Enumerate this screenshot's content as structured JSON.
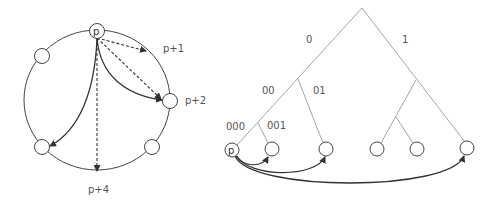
{
  "ring_diagram": {
    "node_label_p": "p",
    "labels": {
      "p_plus_1": "p+1",
      "p_plus_2": "p+2",
      "p_plus_4": "p+4"
    }
  },
  "tree_diagram": {
    "node_label_p": "p",
    "edge_labels": {
      "root_left": "0",
      "root_right": "1",
      "left_left": "00",
      "left_right": "01",
      "leaf_000": "000",
      "leaf_001": "001"
    }
  },
  "colors": {
    "line": "#444444",
    "tree_line": "#999999",
    "arrow": "#333333",
    "text": "#555555"
  }
}
